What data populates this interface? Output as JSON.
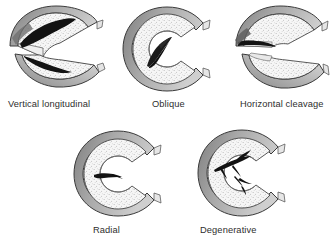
{
  "figure": {
    "background_color": "#ffffff",
    "palette": {
      "outline": "#3a3a3a",
      "rim_dark": "#8d8d8d",
      "rim_mid": "#b5b5b5",
      "body_fill": "#f4f4f4",
      "stipple": "#8a8a8a",
      "tear": "#111111",
      "caption": "#2e2e2e"
    }
  },
  "panels": [
    {
      "id": "vertical-longitudinal",
      "label": "Vertical longitudinal",
      "tear_type": "vertical longitudinal",
      "split": "two separated halves (upper and lower fragment)",
      "tear_description": "long dark vertical split running parallel to the outer rim through both fragments",
      "row": 1,
      "column": 1
    },
    {
      "id": "oblique",
      "label": "Oblique",
      "tear_type": "oblique",
      "split": "single intact C-shaped meniscus",
      "tear_description": "dark diagonal flap tear angling from the inner free edge outward",
      "row": 1,
      "column": 2
    },
    {
      "id": "horizontal-cleavage",
      "label": "Horizontal cleavage",
      "tear_type": "horizontal cleavage",
      "split": "two separated halves (upper and lower leaf)",
      "tear_description": "dark horizontal wedge cleaving the meniscus at the thick outer rim",
      "row": 1,
      "column": 3
    },
    {
      "id": "radial",
      "label": "Radial",
      "tear_type": "radial",
      "split": "single intact C-shaped meniscus",
      "tear_description": "short dark tear running radially inward from the inner free edge",
      "row": 2,
      "column": 1
    },
    {
      "id": "degenerative",
      "label": "Degenerative",
      "tear_type": "degenerative",
      "split": "single intact C-shaped meniscus",
      "tear_description": "complex branching, frayed tears radiating from the inner free edge",
      "row": 2,
      "column": 2
    }
  ]
}
